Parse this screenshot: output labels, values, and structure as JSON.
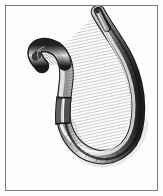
{
  "image": {
    "kind": "engraving-illustration",
    "subject": "earthworm",
    "subject_label": "Earthworm",
    "alt_text": "Antique engraved illustration of an earthworm with a looped, S-curved segmented body",
    "style": "19th-century steel engraving, black and white hatching",
    "background_color": "#fdfdfd",
    "paper_color": "#fefefe",
    "ink_color": "#2b2b2b",
    "mid_tone_color": "#8a8a8a",
    "highlight_color": "#f2f2f0",
    "frame": {
      "present": true,
      "line_color": "#7c7c7c",
      "line_width_px": 1,
      "inset_px": 5
    },
    "anatomy": [
      {
        "name": "anterior-head-end",
        "description": "blunt tapered head at upper left, densely cross-hatched",
        "position": "upper-left"
      },
      {
        "name": "clitellum",
        "description": "smooth pale saddle band near the middle of the body",
        "position": "center"
      },
      {
        "name": "posterior-tail-end",
        "description": "slender tapering tail pointing up at top center",
        "position": "top-center"
      },
      {
        "name": "ventral-loop",
        "description": "large U-shaped loop of the body across the lower half",
        "position": "bottom"
      },
      {
        "name": "segmentation",
        "description": "fine transverse annuli ruled across the whole body",
        "position": "whole-body"
      }
    ],
    "labels": [],
    "caption": ""
  }
}
